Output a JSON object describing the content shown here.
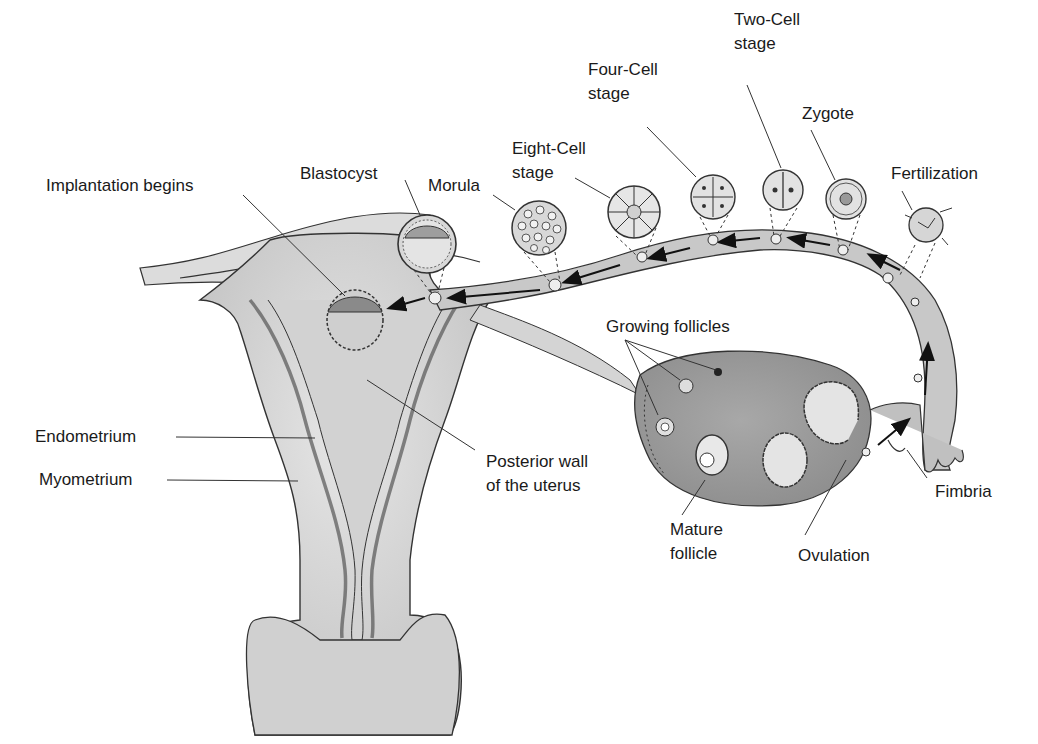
{
  "diagram": {
    "colors": {
      "tissue_light": "#d9d9d9",
      "tissue_mid": "#bdbdbd",
      "tissue_dark": "#9a9a9a",
      "outline": "#2b2b2b",
      "text": "#1a1a1a",
      "background": "#ffffff"
    },
    "labels": {
      "two_cell": {
        "line1": "Two-Cell",
        "line2": "stage"
      },
      "four_cell": {
        "line1": "Four-Cell",
        "line2": "stage"
      },
      "zygote": "Zygote",
      "eight_cell": {
        "line1": "Eight-Cell",
        "line2": "stage"
      },
      "fertilization": "Fertilization",
      "blastocyst": "Blastocyst",
      "morula": "Morula",
      "implantation": "Implantation begins",
      "growing_follicles": "Growing follicles",
      "endometrium": "Endometrium",
      "myometrium": "Myometrium",
      "posterior_wall": {
        "line1": "Posterior wall",
        "line2": "of the uterus"
      },
      "fimbria": "Fimbria",
      "mature_follicle": {
        "line1": "Mature",
        "line2": "follicle"
      },
      "ovulation": "Ovulation"
    },
    "stages_sequence": [
      "Ovulation",
      "Fertilization",
      "Zygote",
      "Two-Cell stage",
      "Four-Cell stage",
      "Eight-Cell stage",
      "Morula",
      "Blastocyst",
      "Implantation begins"
    ],
    "structures": [
      "Uterus",
      "Endometrium",
      "Myometrium",
      "Posterior wall of the uterus",
      "Uterine tube",
      "Ovary",
      "Growing follicles",
      "Mature follicle",
      "Fimbria"
    ]
  }
}
